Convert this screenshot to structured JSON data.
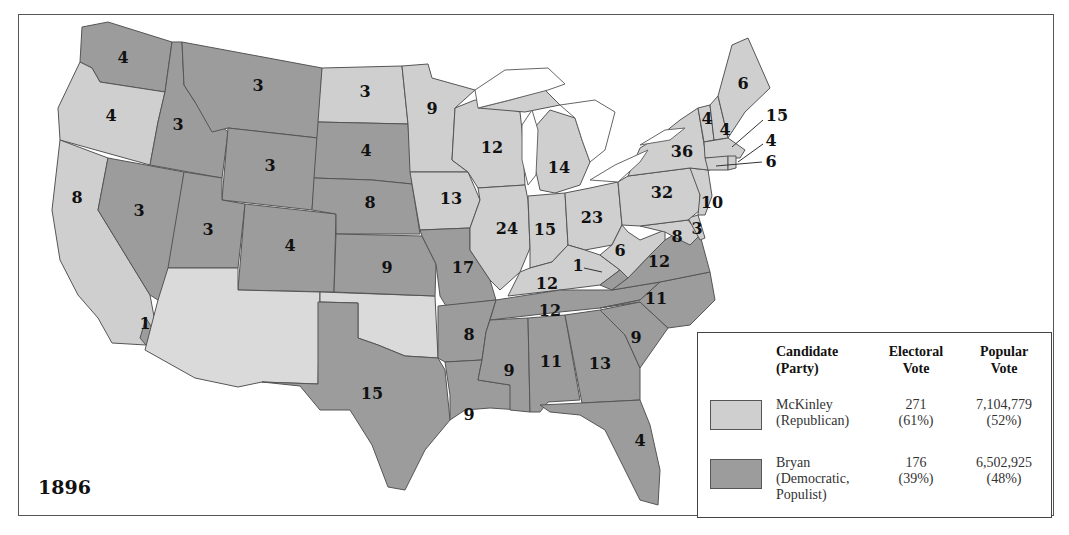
{
  "map": {
    "year": "1896",
    "colors": {
      "republican": "#cfcfcf",
      "democratic": "#9c9c9c",
      "territory": "#dadada"
    },
    "states": [
      {
        "state": "WA",
        "votes": "4",
        "winner": "Bryan"
      },
      {
        "state": "OR",
        "votes": "4",
        "winner": "McKinley"
      },
      {
        "state": "CA",
        "votes": "8",
        "winner": "McKinley"
      },
      {
        "state": "CA-split",
        "votes": "1",
        "winner": "Bryan"
      },
      {
        "state": "ID",
        "votes": "3",
        "winner": "Bryan"
      },
      {
        "state": "NV",
        "votes": "3",
        "winner": "Bryan"
      },
      {
        "state": "MT",
        "votes": "3",
        "winner": "Bryan"
      },
      {
        "state": "WY",
        "votes": "3",
        "winner": "Bryan"
      },
      {
        "state": "UT",
        "votes": "3",
        "winner": "Bryan"
      },
      {
        "state": "CO",
        "votes": "4",
        "winner": "Bryan"
      },
      {
        "state": "ND",
        "votes": "3",
        "winner": "McKinley"
      },
      {
        "state": "SD",
        "votes": "4",
        "winner": "Bryan"
      },
      {
        "state": "NE",
        "votes": "8",
        "winner": "Bryan"
      },
      {
        "state": "KS",
        "votes": "9",
        "winner": "Bryan"
      },
      {
        "state": "TX",
        "votes": "15",
        "winner": "Bryan"
      },
      {
        "state": "MN",
        "votes": "9",
        "winner": "McKinley"
      },
      {
        "state": "IA",
        "votes": "13",
        "winner": "McKinley"
      },
      {
        "state": "MO",
        "votes": "17",
        "winner": "Bryan"
      },
      {
        "state": "AR",
        "votes": "8",
        "winner": "Bryan"
      },
      {
        "state": "LA",
        "votes": "9",
        "winner": "Bryan"
      },
      {
        "state": "WI",
        "votes": "12",
        "winner": "McKinley"
      },
      {
        "state": "IL",
        "votes": "24",
        "winner": "McKinley"
      },
      {
        "state": "MI",
        "votes": "14",
        "winner": "McKinley"
      },
      {
        "state": "IN",
        "votes": "15",
        "winner": "McKinley"
      },
      {
        "state": "OH",
        "votes": "23",
        "winner": "McKinley"
      },
      {
        "state": "KY",
        "votes": "12",
        "winner": "McKinley"
      },
      {
        "state": "KY-split",
        "votes": "1",
        "winner": "Bryan"
      },
      {
        "state": "TN",
        "votes": "12",
        "winner": "Bryan"
      },
      {
        "state": "MS",
        "votes": "9",
        "winner": "Bryan"
      },
      {
        "state": "AL",
        "votes": "11",
        "winner": "Bryan"
      },
      {
        "state": "GA",
        "votes": "13",
        "winner": "Bryan"
      },
      {
        "state": "FL",
        "votes": "4",
        "winner": "Bryan"
      },
      {
        "state": "SC",
        "votes": "9",
        "winner": "Bryan"
      },
      {
        "state": "NC",
        "votes": "11",
        "winner": "Bryan"
      },
      {
        "state": "VA",
        "votes": "12",
        "winner": "Bryan"
      },
      {
        "state": "WV",
        "votes": "6",
        "winner": "McKinley"
      },
      {
        "state": "MD",
        "votes": "8",
        "winner": "McKinley"
      },
      {
        "state": "DE",
        "votes": "3",
        "winner": "McKinley"
      },
      {
        "state": "NJ",
        "votes": "10",
        "winner": "McKinley"
      },
      {
        "state": "PA",
        "votes": "32",
        "winner": "McKinley"
      },
      {
        "state": "NY",
        "votes": "36",
        "winner": "McKinley"
      },
      {
        "state": "VT",
        "votes": "4",
        "winner": "McKinley"
      },
      {
        "state": "NH",
        "votes": "4",
        "winner": "McKinley"
      },
      {
        "state": "ME",
        "votes": "6",
        "winner": "McKinley"
      },
      {
        "state": "MA",
        "votes": "15",
        "winner": "McKinley"
      },
      {
        "state": "RI",
        "votes": "4",
        "winner": "McKinley"
      },
      {
        "state": "CT",
        "votes": "6",
        "winner": "McKinley"
      }
    ],
    "labels": {
      "wa": "4",
      "or": "4",
      "ca": "8",
      "ca1": "1",
      "id": "3",
      "nv": "3",
      "mt": "3",
      "wy": "3",
      "ut": "3",
      "co": "4",
      "nd": "3",
      "sd": "4",
      "ne": "8",
      "ks": "9",
      "tx": "15",
      "mn": "9",
      "ia": "13",
      "mo": "17",
      "ar": "8",
      "la": "9",
      "wi": "12",
      "il": "24",
      "mi": "14",
      "in": "15",
      "oh": "23",
      "ky": "12",
      "ky1": "1",
      "tn": "12",
      "ms": "9",
      "al": "11",
      "ga": "13",
      "fl": "4",
      "sc": "9",
      "nc": "11",
      "va": "12",
      "wv": "6",
      "md": "8",
      "de": "3",
      "nj": "10",
      "pa": "32",
      "ny": "36",
      "vt": "4",
      "nh": "4",
      "me": "6",
      "ma": "15",
      "ri": "4",
      "ct": "6"
    }
  },
  "legend": {
    "headers": {
      "candidate": [
        "Candidate",
        "(Party)"
      ],
      "electoral": [
        "Electoral",
        "Vote"
      ],
      "popular": [
        "Popular",
        "Vote"
      ]
    },
    "rows": [
      {
        "name": "McKinley",
        "party": "(Republican)",
        "party2": "",
        "electoral": "271",
        "electoral_pct": "(61%)",
        "popular": "7,104,779",
        "popular_pct": "(52%)",
        "color": "#cfcfcf"
      },
      {
        "name": "Bryan",
        "party": "(Democratic,",
        "party2": "Populist)",
        "electoral": "176",
        "electoral_pct": "(39%)",
        "popular": "6,502,925",
        "popular_pct": "(48%)",
        "color": "#9c9c9c"
      }
    ]
  }
}
